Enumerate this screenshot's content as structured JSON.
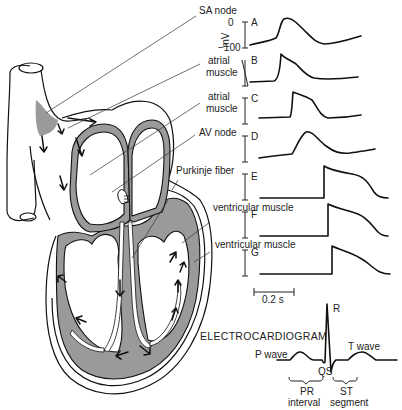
{
  "figure": {
    "labels": {
      "sa_node": "SA node",
      "atrial_muscle_1": [
        "atrial",
        "muscle"
      ],
      "atrial_muscle_2": [
        "atrial",
        "muscle"
      ],
      "av_node": "AV node",
      "purkinje_fiber": "Purkinje fiber",
      "ventricular_muscle_1": "ventricular muscle",
      "ventricular_muscle_2": "ventricular muscle"
    },
    "axis": {
      "unit": "mV",
      "top_tick": "0",
      "bottom_tick": "−100"
    },
    "traces": [
      {
        "id": "A",
        "tissue": "SA node"
      },
      {
        "id": "B",
        "tissue": "atrial muscle"
      },
      {
        "id": "C",
        "tissue": "atrial muscle"
      },
      {
        "id": "D",
        "tissue": "AV node"
      },
      {
        "id": "E",
        "tissue": "Purkinje fiber"
      },
      {
        "id": "F",
        "tissue": "ventricular muscle"
      },
      {
        "id": "G",
        "tissue": "ventricular muscle"
      }
    ],
    "scale_bar": "0.2 s",
    "ecg": {
      "title": "ELECTROCARDIOGRAM",
      "p_wave": "P wave",
      "r": "R",
      "qs": "QS",
      "t_wave": "T wave",
      "pr": [
        "PR",
        "interval"
      ],
      "st": [
        "ST",
        "segment"
      ]
    },
    "colors": {
      "muscle_fill": "#9a9a9a",
      "line": "#111111",
      "background": "#ffffff"
    }
  }
}
